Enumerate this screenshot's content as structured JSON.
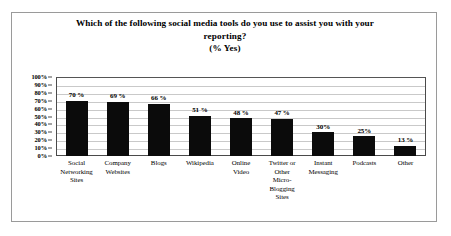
{
  "chart_data": {
    "type": "bar",
    "title": "Which of the following social media tools do you use to assist you with your reporting? (% Yes)",
    "title_lines": [
      "Which of the following social media tools do you use to assist you with your",
      "reporting?",
      "(% Yes)"
    ],
    "categories": [
      "Social Networking Sites",
      "Company Websites",
      "Blogs",
      "Wikipedia",
      "Online Video",
      "Twitter or Other Micro-Blogging Sites",
      "Instant Messaging",
      "Podcasts",
      "Other"
    ],
    "category_lines": [
      [
        "Social",
        "Networking",
        "Sites"
      ],
      [
        "Company",
        "Websites"
      ],
      [
        "Blogs"
      ],
      [
        "Wikipedia"
      ],
      [
        "Online",
        "Video"
      ],
      [
        "Twitter or",
        "Other",
        "Micro-",
        "Blogging",
        "Sites"
      ],
      [
        "Instant",
        "Messaging"
      ],
      [
        "Podcasts"
      ],
      [
        "Other"
      ]
    ],
    "values": [
      70,
      69,
      66,
      51,
      48,
      47,
      30,
      25,
      13
    ],
    "value_labels": [
      "70 %",
      "69 %",
      "66 %",
      "51 %",
      "48 %",
      "47 %",
      "30%",
      "25%",
      "13 %"
    ],
    "xlabel": "",
    "ylabel": "",
    "ylim": [
      0,
      100
    ],
    "ytick_values": [
      0,
      10,
      20,
      30,
      40,
      50,
      60,
      70,
      80,
      90,
      100
    ],
    "ytick_labels": [
      "0%",
      "10%",
      "20%",
      "30%",
      "40%",
      "50%",
      "60%",
      "70%",
      "80%",
      "90%",
      "100%"
    ],
    "grid": true,
    "legend": false,
    "bar_color": "#0b0b0b",
    "grid_color": "#c9c9c9",
    "axis_color": "#4a4a4a",
    "background_color": "#ffffff",
    "border_color": "#9a9a9a"
  }
}
